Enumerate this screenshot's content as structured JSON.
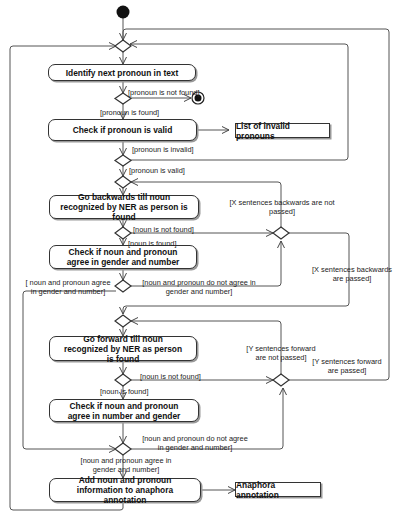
{
  "diagram": {
    "type": "UML activity diagram",
    "activities": [
      {
        "id": "a1",
        "label": "Identify next pronoun in text"
      },
      {
        "id": "a2",
        "label": "Check if pronoun is valid"
      },
      {
        "id": "a3",
        "label": "Go backwards till  noun recognized by NER as person is found"
      },
      {
        "id": "a4",
        "label": "Check if noun and pronoun agree in gender and number"
      },
      {
        "id": "a5",
        "label": "Go forward till  noun  recognized by NER as  person is found"
      },
      {
        "id": "a6",
        "label": "Check if noun and pronoun agree in number and gender"
      },
      {
        "id": "a7",
        "label": "Add noun and pronoun information to anaphora annotation"
      }
    ],
    "objects": [
      {
        "id": "o1",
        "label": "List of invalid pronouns"
      },
      {
        "id": "o2",
        "label": "Anaphora annotation"
      }
    ],
    "guards": {
      "pronoun_not_found": "[pronoun is not found]",
      "pronoun_found": "[pronoun is found]",
      "pronoun_invalid": "[pronoun is invalid]",
      "pronoun_valid": "[pronoun is valid]",
      "x_not_passed": "[X sentences backwards are not passed]",
      "noun_not_found_1": "[noun is not found]",
      "noun_found_1": "[noun is found]",
      "x_passed": "[X sentences backwards are passed]",
      "agree_1": "[ noun and pronoun agree in gender and number]",
      "disagree_1": "[noun and pronoun do not agree in gender and number]",
      "y_not_passed": "[Y sentences forward are not  passed]",
      "y_passed": "[Y sentences forward are passed]",
      "noun_not_found_2": "[noun is not found]",
      "noun_found_2": "[noun is found]",
      "disagree_2": "[noun and pronoun do not agree in gender and number]",
      "agree_2": "[noun and pronoun agree in gender and number]"
    }
  }
}
